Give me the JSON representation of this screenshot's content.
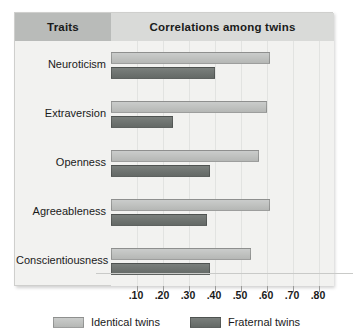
{
  "header": {
    "traits_label": "Traits",
    "correlations_label": "Correlations among twins"
  },
  "legend": [
    {
      "label": "Identical twins",
      "color": "#c0c2c0",
      "icon": "legend-swatch-icon"
    },
    {
      "label": "Fraternal twins",
      "color": "#6e7370",
      "icon": "legend-swatch-icon"
    }
  ],
  "axis": {
    "tick_labels": [
      ".10",
      ".20",
      ".30",
      ".40",
      ".50",
      ".60",
      ".70",
      ".80"
    ],
    "tick_values": [
      0.1,
      0.2,
      0.3,
      0.4,
      0.5,
      0.6,
      0.7,
      0.8
    ]
  },
  "chart_data": {
    "type": "bar",
    "orientation": "horizontal",
    "title": "Correlations among twins",
    "xlabel": "",
    "ylabel": "Traits",
    "xlim": [
      0,
      0.85
    ],
    "grid": true,
    "legend_position": "bottom",
    "categories": [
      "Neuroticism",
      "Extraversion",
      "Openness",
      "Agreeableness",
      "Conscientiousness"
    ],
    "series": [
      {
        "name": "Identical twins",
        "color": "#c0c2c0",
        "values": [
          0.61,
          0.6,
          0.57,
          0.61,
          0.54
        ]
      },
      {
        "name": "Fraternal twins",
        "color": "#6e7370",
        "values": [
          0.4,
          0.24,
          0.38,
          0.37,
          0.38
        ]
      }
    ]
  }
}
